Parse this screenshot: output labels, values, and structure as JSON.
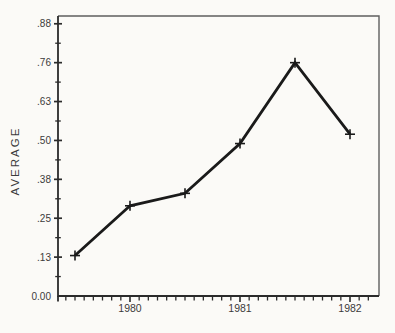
{
  "figure": {
    "background": "#fbfaf7"
  },
  "chart_data": {
    "type": "line",
    "title": "",
    "ylabel": "AVERAGE",
    "xlabel": "",
    "series": [
      {
        "name": "average",
        "x": [
          1979.5,
          1980.0,
          1980.5,
          1981.0,
          1981.5,
          1982.0
        ],
        "values": [
          0.13,
          0.29,
          0.33,
          0.49,
          0.75,
          0.52
        ]
      }
    ],
    "marker": "plus",
    "y_ticks": {
      "values": [
        0,
        0.125,
        0.25,
        0.375,
        0.5,
        0.625,
        0.75,
        0.875
      ],
      "labels": [
        "0.00",
        ".13",
        ".25",
        ".38",
        ".50",
        ".63",
        ".76",
        ".88"
      ],
      "minor_interval": 0.0625
    },
    "x_ticks": {
      "years": [
        1980,
        1981,
        1982
      ],
      "labels": [
        "1980",
        "1981",
        "1982"
      ],
      "minor_interval_months": 1
    },
    "ylim": [
      0,
      0.9
    ],
    "xlim": [
      1979.3455,
      1982.2636
    ],
    "grid": false,
    "legend": null,
    "colors": {
      "line": "#1a1a1a",
      "axis": "#2b2b2b",
      "frame": "#5f5f5f",
      "text": "#3b3b3b",
      "background": "#fbfaf7"
    }
  }
}
